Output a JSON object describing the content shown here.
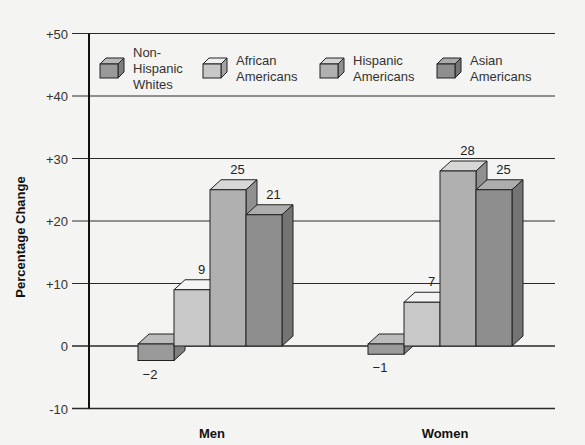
{
  "chart_data": {
    "type": "bar",
    "title": "",
    "xlabel": "",
    "ylabel": "Percentage Change",
    "ylim": [
      -10,
      50
    ],
    "yticks": [
      "+50",
      "+40",
      "+30",
      "+20",
      "+10",
      "0",
      "-10"
    ],
    "grid": true,
    "legend_position": "top-inside",
    "categories": [
      "Men",
      "Women"
    ],
    "series": [
      {
        "name": "Non-Hispanic Whites",
        "legend_lines": [
          "Non-",
          "Hispanic",
          "Whites"
        ],
        "values": [
          -2,
          -1
        ],
        "labels": [
          "−2",
          "−1"
        ],
        "color": "#9a9a9a"
      },
      {
        "name": "African Americans",
        "legend_lines": [
          "African",
          "Americans"
        ],
        "values": [
          9,
          7
        ],
        "labels": [
          "9",
          "7"
        ],
        "color": "#c8c8c8"
      },
      {
        "name": "Hispanic Americans",
        "legend_lines": [
          "Hispanic",
          "Americans"
        ],
        "values": [
          25,
          28
        ],
        "labels": [
          "25",
          "28"
        ],
        "color": "#b0b0b0"
      },
      {
        "name": "Asian Americans",
        "legend_lines": [
          "Asian",
          "Americans"
        ],
        "values": [
          21,
          25
        ],
        "labels": [
          "21",
          "25"
        ],
        "color": "#8e8e8e"
      }
    ],
    "style": "3d-bar"
  }
}
